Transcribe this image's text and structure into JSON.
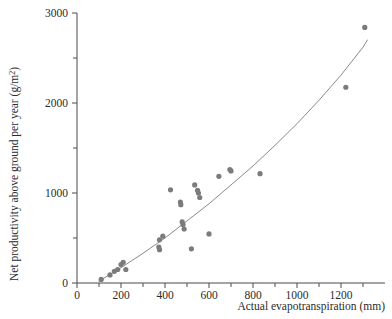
{
  "chart_data": {
    "type": "scatter",
    "title": "",
    "xlabel": "Actual evapotranspiration (mm)",
    "ylabel": "Net productivity above ground per year (g/m2)",
    "ylabel_main": "Net productivity above ground per year (g/m",
    "ylabel_sup": "2",
    "ylabel_tail": ")",
    "xlim": [
      0,
      1400
    ],
    "ylim": [
      0,
      3000
    ],
    "grid": false,
    "legend": null,
    "point_color": "#7b7b7b",
    "line_color": "#8a8a8a",
    "axis_color": "#4a4a4a",
    "xticks_major": [
      0,
      200,
      400,
      600,
      800,
      1000,
      1200
    ],
    "xticks_minor": [
      100,
      300,
      500,
      700,
      900,
      1100,
      1300
    ],
    "xtick_labels": [
      "0",
      "200",
      "400",
      "600",
      "800",
      "1000",
      "1200"
    ],
    "yticks_major": [
      0,
      1000,
      2000,
      3000
    ],
    "yticks_minor": [
      500,
      1500,
      2500
    ],
    "ytick_labels": [
      "0",
      "1000",
      "2000",
      "3000"
    ],
    "points": [
      {
        "x": 110,
        "y": 40
      },
      {
        "x": 150,
        "y": 90
      },
      {
        "x": 170,
        "y": 130
      },
      {
        "x": 185,
        "y": 150
      },
      {
        "x": 200,
        "y": 205
      },
      {
        "x": 210,
        "y": 230
      },
      {
        "x": 222,
        "y": 150
      },
      {
        "x": 375,
        "y": 480
      },
      {
        "x": 372,
        "y": 400
      },
      {
        "x": 375,
        "y": 370
      },
      {
        "x": 390,
        "y": 520
      },
      {
        "x": 425,
        "y": 1035
      },
      {
        "x": 470,
        "y": 900
      },
      {
        "x": 472,
        "y": 870
      },
      {
        "x": 478,
        "y": 680
      },
      {
        "x": 482,
        "y": 650
      },
      {
        "x": 487,
        "y": 600
      },
      {
        "x": 520,
        "y": 380
      },
      {
        "x": 535,
        "y": 1090
      },
      {
        "x": 548,
        "y": 1030
      },
      {
        "x": 552,
        "y": 1000
      },
      {
        "x": 558,
        "y": 950
      },
      {
        "x": 600,
        "y": 545
      },
      {
        "x": 645,
        "y": 1185
      },
      {
        "x": 695,
        "y": 1260
      },
      {
        "x": 700,
        "y": 1245
      },
      {
        "x": 832,
        "y": 1215
      },
      {
        "x": 1222,
        "y": 2175
      },
      {
        "x": 1308,
        "y": 2840
      }
    ],
    "fit_curve": [
      {
        "x": 100,
        "y": 20
      },
      {
        "x": 200,
        "y": 170
      },
      {
        "x": 300,
        "y": 330
      },
      {
        "x": 400,
        "y": 500
      },
      {
        "x": 500,
        "y": 690
      },
      {
        "x": 600,
        "y": 880
      },
      {
        "x": 700,
        "y": 1090
      },
      {
        "x": 800,
        "y": 1300
      },
      {
        "x": 900,
        "y": 1530
      },
      {
        "x": 1000,
        "y": 1770
      },
      {
        "x": 1100,
        "y": 2030
      },
      {
        "x": 1200,
        "y": 2310
      },
      {
        "x": 1300,
        "y": 2620
      },
      {
        "x": 1320,
        "y": 2700
      }
    ]
  }
}
